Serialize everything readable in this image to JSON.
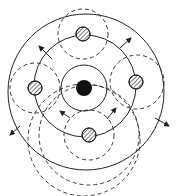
{
  "diagram": {
    "description": "Concentric circles diagram with central black particle, four hatched particles on middle ring, dashed influence circles and outward arrows",
    "colors": {
      "stroke": "#222222",
      "fill_center": "#111111",
      "background": "#ffffff"
    },
    "center_particle": {
      "cx": 84,
      "cy": 88,
      "r": 8,
      "style": "solid-black"
    },
    "solid_rings": [
      {
        "cx": 84,
        "cy": 88,
        "r": 23
      },
      {
        "cx": 85,
        "cy": 86,
        "r": 51
      },
      {
        "cx": 86,
        "cy": 92,
        "r": 78
      }
    ],
    "hatched_particles": [
      {
        "name": "top",
        "cx": 83,
        "cy": 34,
        "r": 7
      },
      {
        "name": "left",
        "cx": 35,
        "cy": 88,
        "r": 7
      },
      {
        "name": "right",
        "cx": 136,
        "cy": 82,
        "r": 7
      },
      {
        "name": "bottom",
        "cx": 89,
        "cy": 135,
        "r": 7
      }
    ],
    "dashed_circles": [
      {
        "cx": 83,
        "cy": 34,
        "r": 25
      },
      {
        "cx": 35,
        "cy": 88,
        "r": 25
      },
      {
        "cx": 137,
        "cy": 82,
        "r": 27
      },
      {
        "cx": 89,
        "cy": 135,
        "r": 25
      },
      {
        "cx": 89,
        "cy": 135,
        "r": 50
      },
      {
        "cx": 84,
        "cy": 140,
        "r": 56
      }
    ],
    "arrows": [
      {
        "from": [
          52,
          59
        ],
        "to": [
          39,
          46
        ]
      },
      {
        "from": [
          120,
          48
        ],
        "to": [
          131,
          38
        ]
      },
      {
        "from": [
          20,
          126
        ],
        "to": [
          10,
          135
        ]
      },
      {
        "from": [
          155,
          118
        ],
        "to": [
          169,
          126
        ]
      },
      {
        "from": [
          70,
          118
        ],
        "to": [
          60,
          111
        ]
      },
      {
        "from": [
          107,
          119
        ],
        "to": [
          116,
          108
        ]
      }
    ]
  }
}
